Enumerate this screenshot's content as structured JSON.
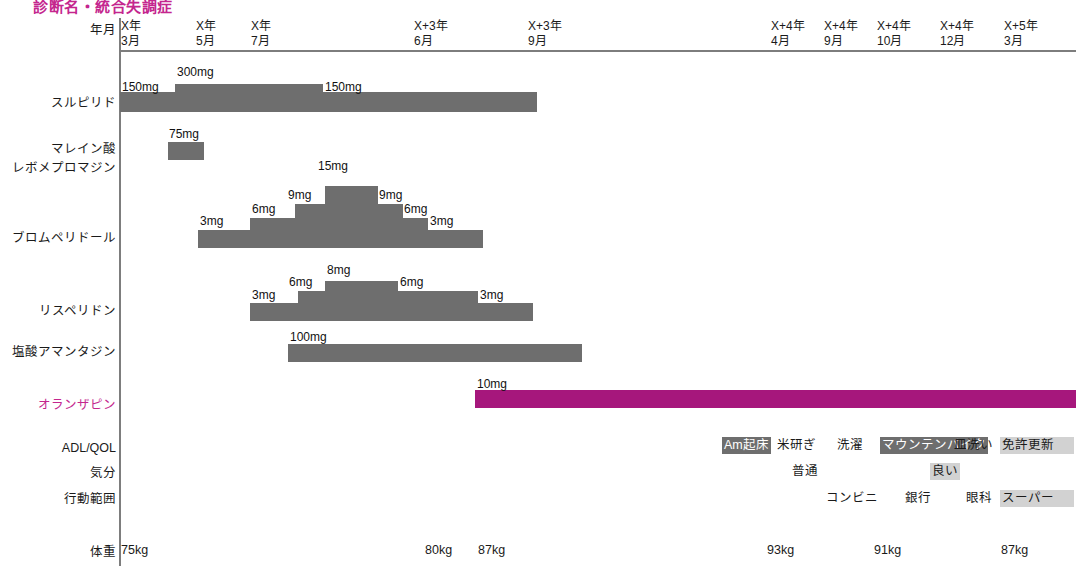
{
  "title": "診断名・統合失調症",
  "axis": {
    "row_header_label": "年月",
    "vertical_line_x": 119,
    "horizontal_line_y": 50
  },
  "chart_data": {
    "type": "bar",
    "title": "診断名・統合失調症",
    "subtitle": "",
    "xlabel": "年月",
    "ylabel": "",
    "grid": false,
    "legend": "none",
    "orientation": "horizontal-timeline",
    "x_ticks": [
      {
        "year": "X年",
        "month": "3月",
        "x": 121
      },
      {
        "year": "X年",
        "month": "5月",
        "x": 196
      },
      {
        "year": "X年",
        "month": "7月",
        "x": 251
      },
      {
        "year": "X+3年",
        "month": "6月",
        "x": 414
      },
      {
        "year": "X+3年",
        "month": "9月",
        "x": 528
      },
      {
        "year": "X+4年",
        "month": "4月",
        "x": 771
      },
      {
        "year": "X+4年",
        "month": "9月",
        "x": 824
      },
      {
        "year": "X+4年",
        "month": "10月",
        "x": 877
      },
      {
        "year": "X+4年",
        "month": "12月",
        "x": 940
      },
      {
        "year": "X+5年",
        "month": "3月",
        "x": 1004
      }
    ],
    "rows": [
      {
        "label": "スルピリド",
        "label_lines": [
          "スルピリド"
        ],
        "accent": false,
        "label_y": 95,
        "baseline_y": 112,
        "segments": [
          {
            "dose": "150mg",
            "x": 120,
            "width": 55,
            "height": 20,
            "label_x": 122,
            "label_y": 81
          },
          {
            "dose": "300mg",
            "x": 175,
            "width": 148,
            "height": 28,
            "label_x": 177,
            "label_y": 66
          },
          {
            "dose": "150mg",
            "x": 323,
            "width": 214,
            "height": 20,
            "label_x": 325,
            "label_y": 81
          }
        ]
      },
      {
        "label": "マレイン酸 レボメプロマジン",
        "label_lines": [
          "マレイン酸",
          "レボメプロマジン"
        ],
        "accent": false,
        "label_y": 140,
        "baseline_y": 160,
        "segments": [
          {
            "dose": "75mg",
            "x": 168,
            "width": 36,
            "height": 18,
            "label_x": 169,
            "label_y": 128
          }
        ]
      },
      {
        "label": "ブロムペリドール",
        "label_lines": [
          "ブロムペリドール"
        ],
        "accent": false,
        "label_y": 230,
        "baseline_y": 248,
        "segments": [
          {
            "dose": "3mg",
            "x": 198,
            "width": 52,
            "height": 18,
            "label_x": 200,
            "label_y": 215
          },
          {
            "dose": "6mg",
            "x": 250,
            "width": 45,
            "height": 30,
            "label_x": 252,
            "label_y": 203
          },
          {
            "dose": "9mg",
            "x": 295,
            "width": 30,
            "height": 44,
            "label_x": 288,
            "label_y": 189
          },
          {
            "dose": "15mg",
            "x": 325,
            "width": 53,
            "height": 62,
            "label_x": 318,
            "label_y": 160
          },
          {
            "dose": "9mg",
            "x": 378,
            "width": 25,
            "height": 44,
            "label_x": 379,
            "label_y": 189
          },
          {
            "dose": "6mg",
            "x": 403,
            "width": 25,
            "height": 30,
            "label_x": 404,
            "label_y": 203
          },
          {
            "dose": "3mg",
            "x": 428,
            "width": 55,
            "height": 18,
            "label_x": 430,
            "label_y": 215
          }
        ]
      },
      {
        "label": "リスペリドン",
        "label_lines": [
          "リスペリドン"
        ],
        "accent": false,
        "label_y": 303,
        "baseline_y": 321,
        "segments": [
          {
            "dose": "3mg",
            "x": 250,
            "width": 48,
            "height": 18,
            "label_x": 252,
            "label_y": 289
          },
          {
            "dose": "6mg",
            "x": 298,
            "width": 27,
            "height": 30,
            "label_x": 289,
            "label_y": 276
          },
          {
            "dose": "8mg",
            "x": 325,
            "width": 73,
            "height": 40,
            "label_x": 327,
            "label_y": 264
          },
          {
            "dose": "6mg",
            "x": 398,
            "width": 80,
            "height": 30,
            "label_x": 400,
            "label_y": 276
          },
          {
            "dose": "3mg",
            "x": 478,
            "width": 55,
            "height": 18,
            "label_x": 480,
            "label_y": 289
          }
        ]
      },
      {
        "label": "塩酸アマンタジン",
        "label_lines": [
          "塩酸アマンタジン"
        ],
        "accent": false,
        "label_y": 344,
        "baseline_y": 362,
        "segments": [
          {
            "dose": "100mg",
            "x": 288,
            "width": 294,
            "height": 18,
            "label_x": 290,
            "label_y": 331
          }
        ]
      },
      {
        "label": "オランザピン",
        "label_lines": [
          "オランザピン"
        ],
        "accent": true,
        "label_y": 397,
        "baseline_y": 408,
        "segments": [
          {
            "dose": "10mg",
            "x": 475,
            "width": 601,
            "height": 18,
            "label_x": 477,
            "label_y": 378
          }
        ]
      }
    ],
    "event_rows": [
      {
        "label": "ADL/QOL",
        "label_y": 440,
        "items_y": 437,
        "items": [
          {
            "text": "Am起床",
            "x": 722,
            "style": "dark"
          },
          {
            "text": "米研ぎ",
            "x": 775,
            "style": "plain"
          },
          {
            "text": "洗濯",
            "x": 835,
            "style": "plain"
          },
          {
            "text": "マウンテンバイク",
            "x": 880,
            "style": "dark"
          },
          {
            "text": "皿洗い",
            "x": 952,
            "style": "plain"
          },
          {
            "text": "免許更新",
            "x": 1000,
            "style": "light"
          }
        ]
      },
      {
        "label": "気分",
        "label_y": 465,
        "items_y": 463,
        "items": [
          {
            "text": "普通",
            "x": 790,
            "style": "plain"
          },
          {
            "text": "良い",
            "x": 930,
            "style": "light"
          }
        ]
      },
      {
        "label": "行動範囲",
        "label_y": 491,
        "items_y": 490,
        "items": [
          {
            "text": "コンビニ",
            "x": 824,
            "style": "plain"
          },
          {
            "text": "銀行",
            "x": 903,
            "style": "plain"
          },
          {
            "text": "眼科",
            "x": 964,
            "style": "plain"
          },
          {
            "text": "スーパー",
            "x": 1000,
            "style": "light"
          }
        ]
      }
    ],
    "weight_row": {
      "label": "体重",
      "label_y": 544,
      "values_y": 543,
      "values": [
        {
          "text": "75kg",
          "x": 121
        },
        {
          "text": "80kg",
          "x": 425
        },
        {
          "text": "87kg",
          "x": 478
        },
        {
          "text": "93kg",
          "x": 767
        },
        {
          "text": "91kg",
          "x": 874
        },
        {
          "text": "87kg",
          "x": 1001
        }
      ]
    }
  },
  "colors": {
    "accent": "#a6177c",
    "title_accent": "#c4268e",
    "bar_gray": "#6e6e6e",
    "badge_light": "#d2d2d2",
    "axis": "#7d7d7d"
  }
}
